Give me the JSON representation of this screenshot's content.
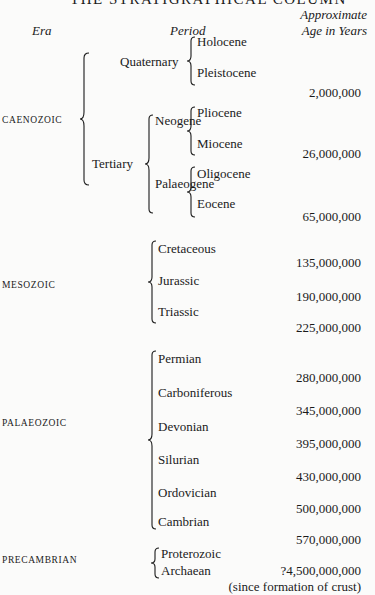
{
  "title": "THE STRATIGRAPHICAL COLUMN",
  "headers": {
    "era": "Era",
    "period": "Period",
    "age_line1": "Approximate",
    "age_line2": "Age in Years"
  },
  "eras": [
    {
      "name": "CAENOZOIC"
    },
    {
      "name": "MESOZOIC"
    },
    {
      "name": "PALAEOZOIC"
    },
    {
      "name": "PRECAMBRIAN"
    }
  ],
  "caenozoic": {
    "quaternary": "Quaternary",
    "tertiary": "Tertiary",
    "neogene": "Neogene",
    "palaeogene": "Palaeogene",
    "holocene": "Holocene",
    "pleistocene": "Pleistocene",
    "pliocene": "Pliocene",
    "miocene": "Miocene",
    "oligocene": "Oligocene",
    "eocene": "Eocene"
  },
  "mesozoic": [
    "Cretaceous",
    "Jurassic",
    "Triassic"
  ],
  "palaeozoic": [
    "Permian",
    "Carboniferous",
    "Devonian",
    "Silurian",
    "Ordovician",
    "Cambrian"
  ],
  "precambrian": [
    "Proterozoic",
    "Archaean"
  ],
  "ages": [
    "2,000,000",
    "26,000,000",
    "65,000,000",
    "135,000,000",
    "190,000,000",
    "225,000,000",
    "280,000,000",
    "345,000,000",
    "395,000,000",
    "430,000,000",
    "500,000,000",
    "570,000,000",
    "?4,500,000,000"
  ],
  "age_note": "(since formation of crust)"
}
